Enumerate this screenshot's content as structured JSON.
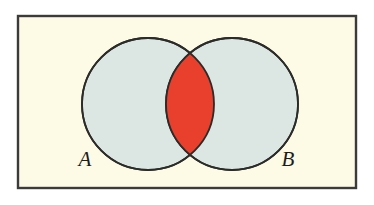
{
  "figure": {
    "name": "venn-diagram-intersection",
    "canvas": {
      "width": 374,
      "height": 205
    },
    "outer_background": "#ffffff"
  },
  "universal_set": {
    "name": "universal-set-rectangle",
    "fill": "#fdfbe6",
    "stroke": "#3b3b39",
    "stroke_width": 2.4,
    "x": 18,
    "y": 16,
    "width": 338,
    "height": 172
  },
  "circles": [
    {
      "id": "circle-a",
      "label": "A",
      "cx": 148,
      "cy": 104,
      "r": 66,
      "fill": "#dce7e4",
      "stroke": "#2b2b29",
      "stroke_width": 1.8
    },
    {
      "id": "circle-b",
      "label": "B",
      "cx": 232,
      "cy": 104,
      "r": 66,
      "fill": "#dce7e4",
      "stroke": "#2b2b29",
      "stroke_width": 1.8
    }
  ],
  "intersection": {
    "id": "intersection-lens",
    "label": "A ∩ B",
    "fill": "#e8402c",
    "stroke": "#2b2b29",
    "stroke_width": 1.8,
    "shaded": true,
    "top_point": {
      "x": 190,
      "y": 60.4
    },
    "bottom_point": {
      "x": 190,
      "y": 147.6
    },
    "left_extent": 172,
    "right_extent": 208
  },
  "labels": [
    {
      "id": "label-a",
      "text": "A",
      "x": 85,
      "y": 166,
      "style": "italic-serif"
    },
    {
      "id": "label-b",
      "text": "B",
      "x": 288,
      "y": 166,
      "style": "italic-serif"
    }
  ],
  "chart_data": {
    "type": "diagram",
    "subtype": "venn",
    "title": "",
    "sets": [
      "A",
      "B"
    ],
    "regions": [
      {
        "name": "A only",
        "shaded": false,
        "color": "#dce7e4"
      },
      {
        "name": "A ∩ B",
        "shaded": true,
        "color": "#e8402c"
      },
      {
        "name": "B only",
        "shaded": false,
        "color": "#dce7e4"
      },
      {
        "name": "universe outside A ∪ B",
        "shaded": false,
        "color": "#fdfbe6"
      }
    ],
    "highlighted_region": "A ∩ B",
    "legend": [],
    "annotations": [
      "A",
      "B"
    ]
  }
}
